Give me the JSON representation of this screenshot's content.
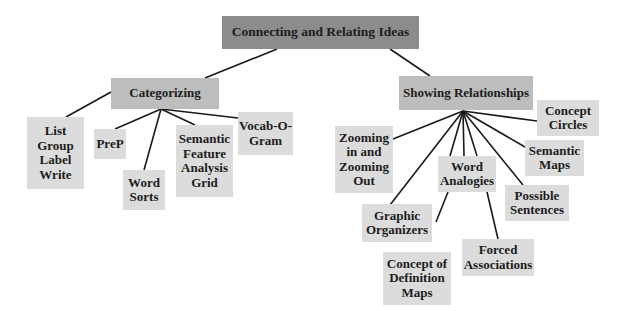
{
  "title": "Connecting and Relating Ideas",
  "colors": {
    "root_fill": "#8c8c8c",
    "branch_fill": "#bdbdbd",
    "leaf_fill": "#dcdcdc",
    "line": "#1a1a1a",
    "text": "#1c1c1c"
  },
  "nodes": {
    "root": {
      "label": "Connecting and Relating Ideas",
      "x": 222,
      "y": 16,
      "w": 197,
      "h": 33
    },
    "categorizing": {
      "label": "Categorizing",
      "x": 111,
      "y": 78,
      "w": 108,
      "h": 31
    },
    "showing": {
      "label": "Showing Relationships",
      "x": 399,
      "y": 76,
      "w": 134,
      "h": 34
    },
    "list_group": {
      "label": "List\nGroup\nLabel\nWrite",
      "x": 27,
      "y": 117,
      "w": 57,
      "h": 72
    },
    "prep": {
      "label": "PreP",
      "x": 94,
      "y": 129,
      "w": 32,
      "h": 30
    },
    "word_sorts": {
      "label": "Word\nSorts",
      "x": 123,
      "y": 170,
      "w": 42,
      "h": 40
    },
    "sfag": {
      "label": "Semantic\nFeature\nAnalysis\nGrid",
      "x": 176,
      "y": 125,
      "w": 57,
      "h": 72
    },
    "vocab": {
      "label": "Vocab-O-\nGram",
      "x": 238,
      "y": 112,
      "w": 55,
      "h": 43
    },
    "concept_circles": {
      "label": "Concept\nCircles",
      "x": 537,
      "y": 100,
      "w": 62,
      "h": 36
    },
    "zooming": {
      "label": "Zooming\nin and\nZooming\nOut",
      "x": 335,
      "y": 126,
      "w": 58,
      "h": 67
    },
    "word_analogies": {
      "label": "Word\nAnalogies",
      "x": 438,
      "y": 156,
      "w": 58,
      "h": 36
    },
    "semantic_maps": {
      "label": "Semantic\nMaps",
      "x": 525,
      "y": 140,
      "w": 59,
      "h": 36
    },
    "possible_sentences": {
      "label": "Possible\nSentences",
      "x": 505,
      "y": 185,
      "w": 64,
      "h": 36
    },
    "graphic_organizers": {
      "label": "Graphic\nOrganizers",
      "x": 362,
      "y": 204,
      "w": 70,
      "h": 38
    },
    "forced_associations": {
      "label": "Forced\nAssociations",
      "x": 462,
      "y": 239,
      "w": 72,
      "h": 37
    },
    "concept_definition": {
      "label": "Concept of\nDefinition\nMaps",
      "x": 383,
      "y": 252,
      "w": 68,
      "h": 53
    }
  },
  "links": [
    {
      "x1": 277,
      "y1": 49,
      "x2": 205,
      "y2": 78
    },
    {
      "x1": 390,
      "y1": 49,
      "x2": 430,
      "y2": 76
    },
    {
      "x1": 111,
      "y1": 92,
      "x2": 66,
      "y2": 117
    },
    {
      "x1": 161,
      "y1": 109,
      "x2": 115,
      "y2": 129
    },
    {
      "x1": 161,
      "y1": 109,
      "x2": 144,
      "y2": 170
    },
    {
      "x1": 161,
      "y1": 109,
      "x2": 195,
      "y2": 125
    },
    {
      "x1": 161,
      "y1": 109,
      "x2": 238,
      "y2": 118
    },
    {
      "x1": 463,
      "y1": 111,
      "x2": 537,
      "y2": 121
    },
    {
      "x1": 463,
      "y1": 111,
      "x2": 393,
      "y2": 139
    },
    {
      "x1": 463,
      "y1": 111,
      "x2": 390,
      "y2": 205
    },
    {
      "x1": 463,
      "y1": 111,
      "x2": 450,
      "y2": 156
    },
    {
      "x1": 463,
      "y1": 111,
      "x2": 464,
      "y2": 156
    },
    {
      "x1": 463,
      "y1": 111,
      "x2": 477,
      "y2": 156
    },
    {
      "x1": 463,
      "y1": 111,
      "x2": 525,
      "y2": 147
    },
    {
      "x1": 463,
      "y1": 111,
      "x2": 523,
      "y2": 185
    },
    {
      "x1": 448,
      "y1": 192,
      "x2": 436,
      "y2": 222
    },
    {
      "x1": 487,
      "y1": 192,
      "x2": 498,
      "y2": 239
    }
  ]
}
